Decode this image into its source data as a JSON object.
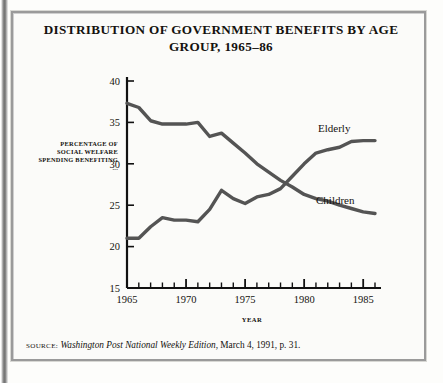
{
  "figure": {
    "title": "DISTRIBUTION OF GOVERNMENT BENEFITS BY AGE GROUP, 1965–86",
    "side_note": "PERCENTAGE OF SOCIAL WELFARE SPENDING BENEFITING ...",
    "source_label": "SOURCE:",
    "source_publication": "Washington Post National Weekly Edition",
    "source_rest": ", March 4, 1991, p. 31.",
    "frame_color": "#9a9a9a",
    "line_color": "#545454",
    "axis_color": "#111111",
    "paper_color": "#fbfbf9"
  },
  "chart_data": {
    "type": "line",
    "title": "DISTRIBUTION OF GOVERNMENT BENEFITS BY AGE GROUP, 1965–86",
    "xlabel": "YEAR",
    "ylabel": "PERCENTAGE OF SOCIAL WELFARE SPENDING BENEFITING ...",
    "xlim": [
      1965,
      1986
    ],
    "ylim": [
      15,
      40
    ],
    "ytick_step": 5,
    "yticks": [
      15,
      20,
      25,
      30,
      35,
      40
    ],
    "ytick_labels": [
      "15",
      "20",
      "25",
      "30",
      "35",
      "40"
    ],
    "xticks": [
      1965,
      1966,
      1967,
      1968,
      1969,
      1970,
      1971,
      1972,
      1973,
      1974,
      1975,
      1976,
      1977,
      1978,
      1979,
      1980,
      1981,
      1982,
      1983,
      1984,
      1985,
      1986
    ],
    "xtick_labels_shown": [
      "1965",
      "1970",
      "1975",
      "1980",
      "1985"
    ],
    "xtick_labels_shown_at": [
      1965,
      1970,
      1975,
      1980,
      1985
    ],
    "grid": false,
    "legend": "inline-annotations",
    "x": [
      1965,
      1966,
      1967,
      1968,
      1969,
      1970,
      1971,
      1972,
      1973,
      1974,
      1975,
      1976,
      1977,
      1978,
      1979,
      1980,
      1981,
      1982,
      1983,
      1984,
      1985,
      1986
    ],
    "series": [
      {
        "name": "Children",
        "label_position": "right-middle",
        "values": [
          37.3,
          36.8,
          35.2,
          34.8,
          34.8,
          34.8,
          35.0,
          33.3,
          33.7,
          32.5,
          31.3,
          30.0,
          29.0,
          28.0,
          27.2,
          26.3,
          25.8,
          25.5,
          25.0,
          24.6,
          24.2,
          24.0
        ]
      },
      {
        "name": "Elderly",
        "label_position": "right-upper",
        "values": [
          21.0,
          21.0,
          22.4,
          23.5,
          23.2,
          23.2,
          23.0,
          24.5,
          26.8,
          25.8,
          25.2,
          26.0,
          26.3,
          27.0,
          28.5,
          30.0,
          31.3,
          31.7,
          32.0,
          32.7,
          32.8,
          32.8
        ]
      }
    ],
    "annotations": [
      {
        "text": "Elderly",
        "near_year": 1982
      },
      {
        "text": "Children",
        "near_year": 1982
      }
    ]
  }
}
